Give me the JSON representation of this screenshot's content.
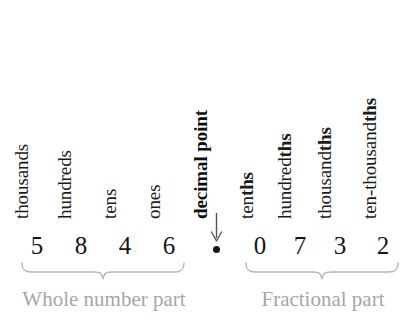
{
  "diagram": {
    "number": "5846.0732",
    "colors": {
      "text": "#151515",
      "muted": "#a6a6a6",
      "brace": "#b5b5b5",
      "arrow": "#4a4a4a",
      "background": "#ffffff"
    },
    "place_labels": [
      {
        "id": "thousands",
        "prefix": "thousands",
        "suffix": "",
        "bold": false
      },
      {
        "id": "hundreds",
        "prefix": "hundreds",
        "suffix": "",
        "bold": false
      },
      {
        "id": "tens",
        "prefix": "tens",
        "suffix": "",
        "bold": false
      },
      {
        "id": "ones",
        "prefix": "ones",
        "suffix": "",
        "bold": false
      },
      {
        "id": "decimal-point",
        "prefix": "decimal point",
        "suffix": "",
        "bold": true
      },
      {
        "id": "tenths",
        "prefix": "ten",
        "suffix": "ths",
        "bold": false
      },
      {
        "id": "hundredths",
        "prefix": "hundred",
        "suffix": "ths",
        "bold": false
      },
      {
        "id": "thousandths",
        "prefix": "thousand",
        "suffix": "ths",
        "bold": false
      },
      {
        "id": "ten-thousandths",
        "prefix": "ten-thousand",
        "suffix": "ths",
        "bold": false
      }
    ],
    "digits": {
      "whole": [
        "5",
        "8",
        "4",
        "6"
      ],
      "separator": "•",
      "fraction": [
        "0",
        "7",
        "3",
        "2"
      ]
    },
    "captions": {
      "whole": "Whole number part",
      "fraction": "Fractional part"
    },
    "arrow": {
      "name": "decimal-point-arrow",
      "direction": "down"
    }
  }
}
